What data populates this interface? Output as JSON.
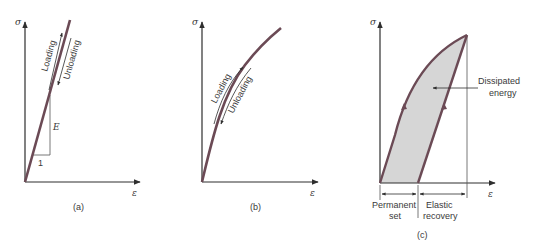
{
  "panels": [
    {
      "id": "a",
      "caption": "(a)",
      "y_axis_label": "σ",
      "x_axis_label": "ε",
      "loading_label": "Loading",
      "unloading_label": "Unloading",
      "slope_label": "E",
      "run_label": "1"
    },
    {
      "id": "b",
      "caption": "(b)",
      "y_axis_label": "σ",
      "x_axis_label": "ε",
      "loading_label": "Loading",
      "unloading_label": "Unloading"
    },
    {
      "id": "c",
      "caption": "(c)",
      "y_axis_label": "σ",
      "x_axis_label": "ε",
      "area_label_line1": "Dissipated",
      "area_label_line2": "energy",
      "permanent_set_line1": "Permanent",
      "permanent_set_line2": "set",
      "elastic_recovery_line1": "Elastic",
      "elastic_recovery_line2": "recovery"
    }
  ],
  "colors": {
    "curve": "#6b4a55",
    "axis": "#2e2e2e",
    "fill": "#d6d6d6"
  }
}
